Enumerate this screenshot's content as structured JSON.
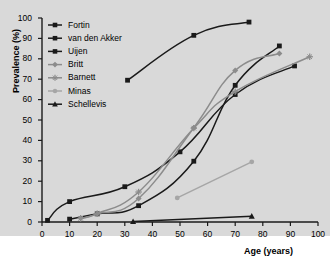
{
  "chart_data": {
    "type": "line",
    "title": "",
    "xlabel": "Age (years)",
    "ylabel": "Prevalence (%)",
    "xlim": [
      0,
      100
    ],
    "ylim": [
      0,
      100
    ],
    "xticks": [
      0,
      10,
      20,
      30,
      40,
      50,
      60,
      70,
      80,
      90,
      100
    ],
    "yticks": [
      0,
      10,
      20,
      30,
      40,
      50,
      60,
      70,
      80,
      90,
      100
    ],
    "grid": false,
    "legend_position": "top-left",
    "background": "#d9d9d9",
    "series": [
      {
        "name": "Fortin",
        "color": "#1a1a1a",
        "marker": "square",
        "points": [
          [
            31,
            69.5
          ],
          [
            55,
            91.5
          ],
          [
            75,
            98.0
          ]
        ]
      },
      {
        "name": "van den Akker",
        "color": "#1a1a1a",
        "marker": "square",
        "points": [
          [
            2,
            0.8
          ],
          [
            10,
            10.0
          ],
          [
            30,
            17.3
          ],
          [
            50,
            34.4
          ],
          [
            70,
            62.5
          ],
          [
            91.5,
            76.5
          ]
        ]
      },
      {
        "name": "Uijen",
        "color": "#1a1a1a",
        "marker": "square",
        "points": [
          [
            10,
            1.4
          ],
          [
            20,
            4.0
          ],
          [
            35,
            8.0
          ],
          [
            55,
            29.8
          ],
          [
            70,
            67.0
          ],
          [
            86,
            86.3
          ]
        ]
      },
      {
        "name": "Britt",
        "color": "#8c8c8c",
        "marker": "diamond",
        "points": [
          [
            14,
            1.8
          ],
          [
            20,
            4.0
          ],
          [
            35,
            11.5
          ],
          [
            55,
            46.2
          ],
          [
            70,
            74.3
          ],
          [
            86,
            82.6
          ]
        ]
      },
      {
        "name": "Barnett",
        "color": "#8c8c8c",
        "marker": "star",
        "points": [
          [
            14,
            1.8
          ],
          [
            20,
            4.1
          ],
          [
            35,
            14.7
          ],
          [
            55,
            46.0
          ],
          [
            70,
            63.9
          ],
          [
            97,
            81.0
          ]
        ]
      },
      {
        "name": "Minas",
        "color": "#a6a6a6",
        "marker": "circle",
        "points": [
          [
            49,
            11.8
          ],
          [
            76,
            29.5
          ]
        ]
      },
      {
        "name": "Schellevis",
        "color": "#1a1a1a",
        "marker": "triangle",
        "points": [
          [
            33,
            0.2
          ],
          [
            76,
            2.8
          ]
        ]
      }
    ]
  },
  "legend": {
    "items": [
      {
        "label": "Fortin"
      },
      {
        "label": "van den Akker"
      },
      {
        "label": "Uijen"
      },
      {
        "label": "Britt"
      },
      {
        "label": "Barnett"
      },
      {
        "label": "Minas"
      },
      {
        "label": "Schellevis"
      }
    ]
  }
}
